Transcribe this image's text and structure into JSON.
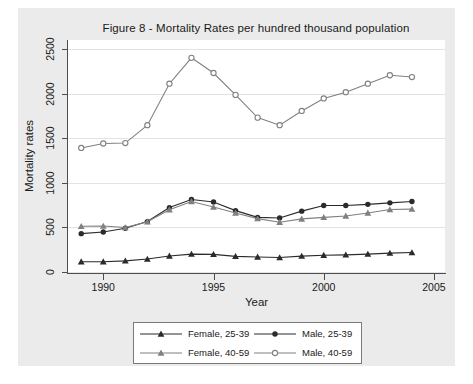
{
  "figure": {
    "title": "Figure 8 - Mortality Rates per hundred thousand population",
    "xaxis_title": "Year",
    "yaxis_title": "Mortality rates"
  },
  "colors": {
    "dark_series": "#2b2b2b",
    "light_series": "#808080",
    "plot_background": "#ffffff",
    "graph_background": "#ebebeb",
    "gridline": "#e3e3e3",
    "axis": "#4d4d4d",
    "text": "#1a1a1a"
  },
  "legend": {
    "entries": [
      {
        "label": "Female, 25-39",
        "marker": "filled-triangle",
        "color": "#2b2b2b"
      },
      {
        "label": "Male, 25-39",
        "marker": "filled-circle",
        "color": "#2b2b2b"
      },
      {
        "label": "Female, 40-59",
        "marker": "filled-triangle",
        "color": "#808080"
      },
      {
        "label": "Male, 40-59",
        "marker": "open-circle",
        "color": "#808080"
      }
    ]
  },
  "chart_data": {
    "type": "line",
    "title": "Figure 8 - Mortality Rates per hundred thousand population",
    "xlabel": "Year",
    "ylabel": "Mortality rates",
    "xlim": [
      1988.4,
      2005.5
    ],
    "ylim": [
      0,
      2600
    ],
    "xticks": [
      1990,
      1995,
      2000,
      2005
    ],
    "yticks": [
      0,
      500,
      1000,
      1500,
      2000,
      2500
    ],
    "grid": "horizontal",
    "legend_position": "below-plot",
    "x": [
      1989,
      1990,
      1991,
      1992,
      1993,
      1994,
      1995,
      1996,
      1997,
      1998,
      1999,
      2000,
      2001,
      2002,
      2003,
      2004
    ],
    "series": [
      {
        "name": "Female, 25-39",
        "marker": "filled-triangle",
        "color": "#2b2b2b",
        "values": [
          115,
          115,
          125,
          145,
          180,
          200,
          198,
          175,
          168,
          162,
          178,
          188,
          192,
          200,
          212,
          218
        ]
      },
      {
        "name": "Male, 25-39",
        "marker": "filled-circle",
        "color": "#2b2b2b",
        "values": [
          430,
          448,
          490,
          565,
          722,
          812,
          785,
          688,
          612,
          605,
          682,
          745,
          745,
          758,
          775,
          790
        ]
      },
      {
        "name": "Female, 40-59",
        "marker": "filled-triangle",
        "color": "#808080",
        "values": [
          512,
          515,
          498,
          562,
          698,
          790,
          728,
          662,
          598,
          558,
          595,
          612,
          628,
          662,
          700,
          705
        ]
      },
      {
        "name": "Male, 40-59",
        "marker": "open-circle",
        "color": "#808080",
        "values": [
          1390,
          1440,
          1445,
          1645,
          2110,
          2400,
          2230,
          1985,
          1730,
          1645,
          1805,
          1945,
          2015,
          2110,
          2205,
          2185
        ]
      }
    ]
  }
}
